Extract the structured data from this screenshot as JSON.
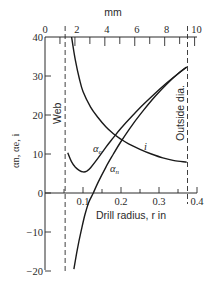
{
  "chart_data": {
    "type": "line",
    "title": "",
    "xlabel": "Drill radius, r in",
    "ylabel": "αn, αe, i",
    "top_axis_label": "mm",
    "xlim": [
      0,
      0.4
    ],
    "ylim": [
      -20,
      40
    ],
    "x_ticks": [
      0.1,
      0.2,
      0.3,
      0.4
    ],
    "x_tick_labels": [
      "0.1",
      "0.2",
      "0.3",
      "0.4"
    ],
    "y_ticks": [
      -20,
      -10,
      0,
      10,
      20,
      30,
      40
    ],
    "y_tick_labels": [
      "−20",
      "−10",
      "0",
      "10",
      "20",
      "30",
      "40"
    ],
    "top_ticks_mm": [
      0,
      2,
      4,
      6,
      8,
      10
    ],
    "top_tick_labels": [
      "0",
      "2",
      "4",
      "6",
      "8",
      "10"
    ],
    "grid": false,
    "legend": "inline labels",
    "vertical_lines": [
      {
        "name": "Web",
        "x": 0.053
      },
      {
        "name": "Outside dia.",
        "x": 0.375
      }
    ],
    "series": [
      {
        "name": "i",
        "label": "i",
        "x": [
          0.07,
          0.08,
          0.09,
          0.1,
          0.12,
          0.14,
          0.16,
          0.18,
          0.2,
          0.22,
          0.25,
          0.28,
          0.31,
          0.34,
          0.373
        ],
        "values": [
          40,
          34,
          29.5,
          26,
          22,
          19.3,
          17,
          15.2,
          13.8,
          12.6,
          11.2,
          10.0,
          9.0,
          8.3,
          7.9
        ]
      },
      {
        "name": "αe",
        "label": "αe",
        "x": [
          0.06,
          0.07,
          0.08,
          0.09,
          0.1,
          0.11,
          0.12,
          0.14,
          0.16,
          0.18,
          0.2,
          0.23,
          0.26,
          0.29,
          0.32,
          0.35,
          0.373
        ],
        "values": [
          10.3,
          8.0,
          6.6,
          5.8,
          5.4,
          5.6,
          6.5,
          9.0,
          11.7,
          14.2,
          16.6,
          19.8,
          22.8,
          25.6,
          28.2,
          30.6,
          32.3
        ]
      },
      {
        "name": "αn",
        "label": "αn",
        "x": [
          0.076,
          0.085,
          0.095,
          0.105,
          0.115,
          0.127,
          0.14,
          0.16,
          0.18,
          0.2,
          0.23,
          0.26,
          0.29,
          0.32,
          0.35,
          0.373
        ],
        "values": [
          -19.5,
          -14.5,
          -9.8,
          -5.6,
          -2.4,
          0,
          2.8,
          6.6,
          10.0,
          13.2,
          17.5,
          21.3,
          24.8,
          27.9,
          30.6,
          32.3
        ]
      }
    ],
    "annotations": [
      {
        "text": "Web",
        "x": 0.053,
        "rotated": true
      },
      {
        "text": "Outside dia.",
        "x": 0.375,
        "rotated": true
      },
      {
        "text": "αe",
        "x": 0.13,
        "y": 10.5
      },
      {
        "text": "αn",
        "x": 0.145,
        "y": 3.5
      },
      {
        "text": "i",
        "x": 0.265,
        "y": 11.5
      }
    ]
  },
  "labels": {
    "top_axis": "mm",
    "x_axis": "Drill radius, r in",
    "y_axis": "αn, αe, i",
    "web": "Web",
    "outside": "Outside dia.",
    "series_i": "i",
    "series_ae_main": "α",
    "series_ae_sub": "e",
    "series_an_main": "α",
    "series_an_sub": "n"
  }
}
